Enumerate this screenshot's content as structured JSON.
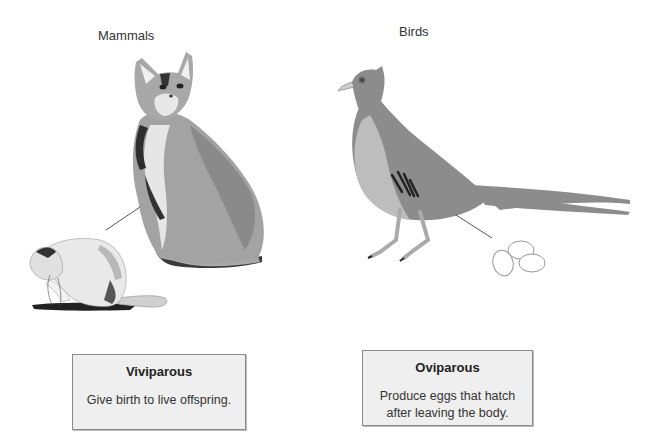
{
  "diagram": {
    "groups": [
      {
        "heading": "Mammals",
        "illustration": "cat-with-kitten",
        "box": {
          "title": "Viviparous",
          "description": "Give birth to live offspring."
        }
      },
      {
        "heading": "Birds",
        "illustration": "pheasant-with-eggs",
        "box": {
          "title": "Oviparous",
          "description_lines": [
            "Produce eggs that hatch",
            "after leaving the body."
          ]
        }
      }
    ],
    "colors": {
      "box_fill": "#efefef",
      "box_border": "#8a8a8a",
      "cat_gray": "#9a9a9a",
      "bird_body": "#8c8c8c",
      "bird_breast": "#bdbdbd"
    }
  }
}
